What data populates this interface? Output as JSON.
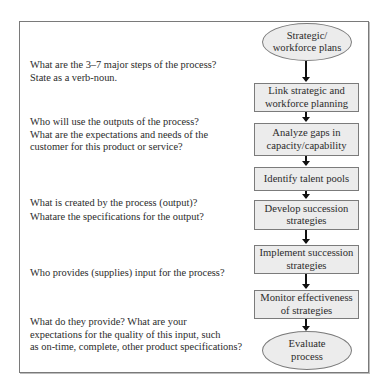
{
  "questions": [
    {
      "lines": [
        "What are the 3–7 major steps of the process?",
        "State as a verb-noun."
      ]
    },
    {
      "lines": [
        "Who will use the outputs of the process?",
        "What are the expectations and needs of the",
        "customer for this product or service?"
      ]
    },
    {
      "lines": [
        "What is created by the process (output)?",
        "Whatare the specifications for the output?"
      ]
    },
    {
      "lines": [
        "Who provides (supplies) input for the process?"
      ]
    },
    {
      "lines": [
        "What do they provide? What are your",
        "expectations for the quality of this input, such",
        "as on-time, complete, other product specifications?"
      ]
    }
  ],
  "flowchart": {
    "start": {
      "shape": "ellipse",
      "lines": [
        "Strategic/",
        "workforce plans"
      ]
    },
    "steps": [
      {
        "shape": "rectangle",
        "lines": [
          "Link strategic and",
          "workforce planning"
        ]
      },
      {
        "shape": "rectangle",
        "lines": [
          "Analyze gaps in",
          "capacity/capability"
        ]
      },
      {
        "shape": "rectangle",
        "lines": [
          "Identify talent pools"
        ]
      },
      {
        "shape": "rectangle",
        "lines": [
          "Develop succession",
          "strategies"
        ]
      },
      {
        "shape": "rectangle",
        "lines": [
          "Implement succession",
          "strategies"
        ]
      },
      {
        "shape": "rectangle",
        "lines": [
          "Monitor effectiveness",
          "of strategies"
        ]
      }
    ],
    "end": {
      "shape": "ellipse",
      "lines": [
        "Evaluate",
        "process"
      ]
    }
  },
  "colors": {
    "node_fill": "#ececec",
    "node_border": "#7b7b7b",
    "arrow": "#111111",
    "frame_border": "#7a7a7a"
  }
}
